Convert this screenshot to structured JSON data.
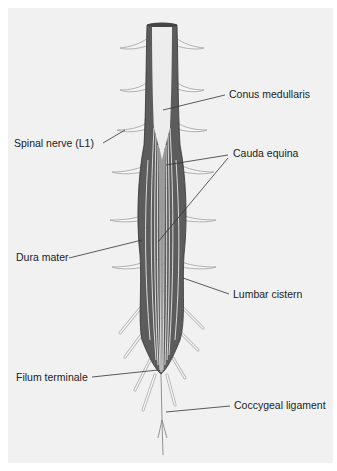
{
  "figure": {
    "type": "anatomical-diagram",
    "colors": {
      "background": "#f1f1f1",
      "dura": "#5a5a5a",
      "cord": "#ececec",
      "nerve_outline": "#9a9a9a",
      "leader_line": "#333333"
    }
  },
  "labels": {
    "conus_medullaris": "Conus medullaris",
    "spinal_nerve_l1": "Spinal nerve (L1)",
    "cauda_equina": "Cauda equina",
    "dura_mater": "Dura mater",
    "lumbar_cistern": "Lumbar cistern",
    "filum_terminale": "Filum terminale",
    "coccygeal_ligament": "Coccygeal ligament"
  }
}
